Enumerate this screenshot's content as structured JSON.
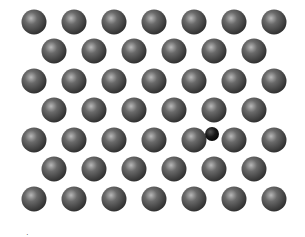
{
  "diagram": {
    "host_atom": {
      "color": "#4a4a4a",
      "highlight": "#b8b8b8",
      "shadow": "#1e1e1e",
      "radius": 12.5
    },
    "interstitial_atom": {
      "color": "#111111",
      "highlight": "#555555",
      "radius": 7,
      "cx": 212,
      "cy": 134
    },
    "rows": [
      {
        "y": 22,
        "xs": [
          34,
          74,
          114,
          154,
          194,
          234,
          274
        ]
      },
      {
        "y": 51,
        "xs": [
          54,
          94,
          134,
          174,
          214,
          254
        ]
      },
      {
        "y": 81,
        "xs": [
          34,
          74,
          114,
          154,
          194,
          234,
          274
        ]
      },
      {
        "y": 110,
        "xs": [
          54,
          94,
          134,
          174,
          214,
          254
        ]
      },
      {
        "y": 140,
        "xs": [
          34,
          74,
          114,
          154,
          194,
          234,
          274
        ]
      },
      {
        "y": 169,
        "xs": [
          54,
          94,
          134,
          174,
          214,
          254
        ]
      },
      {
        "y": 199,
        "xs": [
          34,
          74,
          114,
          154,
          194,
          234,
          274
        ]
      }
    ],
    "label": "·"
  }
}
